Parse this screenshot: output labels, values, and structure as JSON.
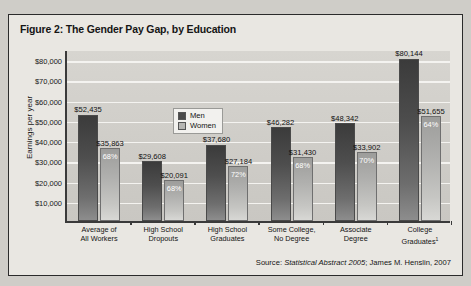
{
  "figure": {
    "title": "Figure 2: The Gender Pay Gap, by Education",
    "source_prefix": "Source:",
    "source_italic": "Statistical Abstract 2005",
    "source_rest": "; James M. Henslin, 2007"
  },
  "legend": {
    "position": "top-left-inside-plot",
    "men_label": "Men",
    "women_label": "Women"
  },
  "colors": {
    "men_bar": "#4a4a4a",
    "women_bar": "#b6b6b3",
    "plot_background": "#cfcdc8",
    "gridline": "#f4f3f0",
    "figure_background": "#e9e7e2",
    "frame_border": "#2b2b2b",
    "axis": "#3a3a3a",
    "pct_text": "#ffffff"
  },
  "chart_data": {
    "type": "bar",
    "title": "Figure 2: The Gender Pay Gap, by Education",
    "xlabel": "",
    "ylabel": "Earnings per year",
    "ylim": [
      0,
      85000
    ],
    "ytick_values": [
      10000,
      20000,
      30000,
      40000,
      50000,
      60000,
      70000,
      80000
    ],
    "ytick_labels": [
      "$10,000",
      "$20,000",
      "$30,000",
      "$40,000",
      "$50,000",
      "$60,000",
      "$70,000",
      "$80,000"
    ],
    "grid": true,
    "legend_position": "upper left",
    "categories": [
      "Average of\nAll Workers",
      "High School\nDropouts",
      "High School\nGraduates",
      "Some College,\nNo Degree",
      "Associate\nDegree",
      "College\nGraduates"
    ],
    "series": [
      {
        "name": "Men",
        "values": [
          52435,
          29608,
          37680,
          46282,
          48342,
          80144
        ],
        "labels": [
          "$52,435",
          "$29,608",
          "$37,680",
          "$46,282",
          "$48,342",
          "$80,144"
        ]
      },
      {
        "name": "Women",
        "values": [
          35863,
          20091,
          27184,
          31430,
          33902,
          51655
        ],
        "labels": [
          "$35,863",
          "$20,091",
          "$27,184",
          "$31,430",
          "$33,902",
          "$51,655"
        ],
        "pct_of_men": [
          "68%",
          "68%",
          "72%",
          "68%",
          "70%",
          "64%"
        ]
      }
    ]
  },
  "categories_display": [
    {
      "line1": "Average of",
      "line2": "All Workers",
      "sup": ""
    },
    {
      "line1": "High School",
      "line2": "Dropouts",
      "sup": ""
    },
    {
      "line1": "High School",
      "line2": "Graduates",
      "sup": ""
    },
    {
      "line1": "Some College,",
      "line2": "No Degree",
      "sup": ""
    },
    {
      "line1": "Associate",
      "line2": "Degree",
      "sup": ""
    },
    {
      "line1": "College",
      "line2": "Graduates",
      "sup": "1"
    }
  ]
}
